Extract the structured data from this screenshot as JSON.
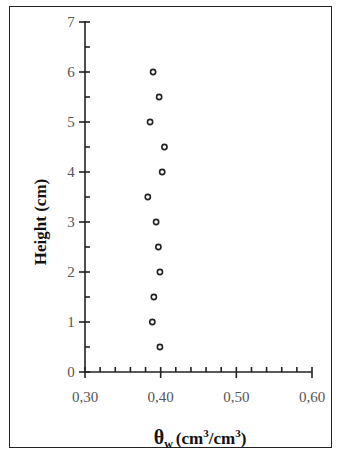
{
  "chart_data": {
    "type": "scatter",
    "title": "",
    "xlabel": "θw (cm3/cm3)",
    "xlabel_parts": {
      "symbol": "θ",
      "sub": "w",
      "unit_open": "(cm",
      "sup1": "3",
      "slash": "/cm",
      "sup2": "3",
      "unit_close": ")"
    },
    "ylabel": "Height (cm)",
    "xlim": [
      0.3,
      0.6
    ],
    "ylim": [
      0,
      7
    ],
    "x_ticks": [
      "0,30",
      "0,40",
      "0,50",
      "0,60"
    ],
    "y_ticks": [
      "0",
      "1",
      "2",
      "3",
      "4",
      "5",
      "6",
      "7"
    ],
    "grid": false,
    "legend": null,
    "series": [
      {
        "name": "θw",
        "marker": "open-circle",
        "points": [
          {
            "x": 0.399,
            "y": 0.5
          },
          {
            "x": 0.389,
            "y": 1.0
          },
          {
            "x": 0.391,
            "y": 1.5
          },
          {
            "x": 0.399,
            "y": 2.0
          },
          {
            "x": 0.397,
            "y": 2.5
          },
          {
            "x": 0.394,
            "y": 3.0
          },
          {
            "x": 0.383,
            "y": 3.5
          },
          {
            "x": 0.402,
            "y": 4.0
          },
          {
            "x": 0.405,
            "y": 4.5
          },
          {
            "x": 0.386,
            "y": 5.0
          },
          {
            "x": 0.398,
            "y": 5.5
          },
          {
            "x": 0.39,
            "y": 6.0
          }
        ]
      }
    ]
  }
}
